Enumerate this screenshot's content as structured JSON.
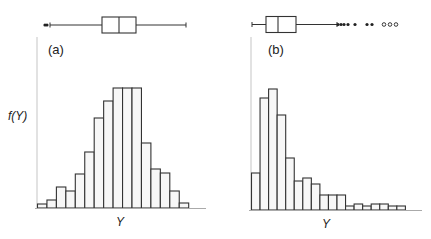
{
  "colors": {
    "bar_fill": "#f7f7f7",
    "bar_stroke": "#333333",
    "axis": "#cccccc",
    "baseline": "#999999",
    "outlier_filled": "#222222"
  },
  "chart_data": [
    {
      "type": "bar",
      "subtype": "histogram_with_boxplot",
      "panel_label": "(a)",
      "title": "",
      "xlabel": "Y",
      "ylabel": "f(Y)",
      "grid": false,
      "legend": null,
      "description": "Roughly symmetric distribution",
      "bin_count": 16,
      "values": [
        4,
        8,
        21,
        17,
        34,
        56,
        90,
        107,
        120,
        120,
        120,
        65,
        39,
        35,
        17,
        5
      ],
      "boxplot": {
        "whisker_low_px": 50,
        "q1_px": 102,
        "median_px": 119,
        "q3_px": 136,
        "whisker_high_px": 186,
        "outliers_low_px": [
          45,
          47
        ],
        "outliers_high_px": []
      }
    },
    {
      "type": "bar",
      "subtype": "histogram_with_boxplot",
      "panel_label": "(b)",
      "title": "",
      "xlabel": "Y",
      "ylabel": "",
      "grid": false,
      "legend": null,
      "description": "Right-skewed distribution",
      "bin_count": 18,
      "values": [
        37,
        112,
        121,
        95,
        52,
        29,
        32,
        26,
        15,
        15,
        15,
        4,
        6,
        4,
        6,
        6,
        4,
        4
      ],
      "boxplot": {
        "whisker_low_px": 252,
        "q1_px": 266,
        "median_px": 278,
        "q3_px": 296,
        "whisker_high_px": 337,
        "outliers_high_filled_px": [
          338,
          341,
          344,
          348,
          355,
          367,
          372
        ],
        "outliers_high_open_px": [
          384,
          390,
          396
        ]
      }
    }
  ]
}
